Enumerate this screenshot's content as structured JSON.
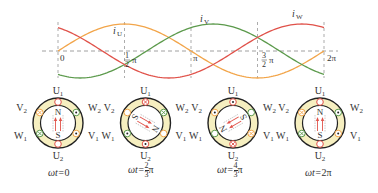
{
  "waveform": {
    "axis": {
      "y_label_zero": "0",
      "x_ticks": [
        {
          "label": "0",
          "x": 58
        },
        {
          "label_num": "1",
          "label_den": "2",
          "label_sym": "π",
          "x": 124.5
        },
        {
          "label": "π",
          "x": 191
        },
        {
          "label_num": "3",
          "label_den": "2",
          "label_sym": "π",
          "x": 257.5
        },
        {
          "label": "2π",
          "x": 324
        }
      ]
    },
    "series_labels": {
      "iU": "i",
      "iU_sub": "U",
      "iV": "i",
      "iV_sub": "V",
      "iW": "i",
      "iW_sub": "W"
    },
    "colors": {
      "iU": "#f2a54a",
      "iV": "#5c9a4c",
      "iW": "#e0524a",
      "grid": "#888888"
    }
  },
  "chart_data": {
    "type": "line",
    "title": "",
    "xlabel": "ωt",
    "ylabel": "i",
    "x_ticks": [
      "0",
      "1/2 π",
      "π",
      "3/2 π",
      "2π"
    ],
    "series": [
      {
        "name": "iU",
        "formula": "sin(ωt)",
        "values_at_ticks": [
          0,
          1,
          0,
          -1,
          0
        ]
      },
      {
        "name": "iV",
        "formula": "sin(ωt - 2π/3)",
        "values_at_ticks": [
          -0.87,
          0.5,
          0.87,
          -0.5,
          -0.87
        ]
      },
      {
        "name": "iW",
        "formula": "sin(ωt + 2π/3)",
        "values_at_ticks": [
          0.87,
          -0.5,
          -0.87,
          0.5,
          0.87
        ]
      }
    ],
    "xlim": [
      0,
      6.283
    ],
    "ylim": [
      -1,
      1
    ],
    "grid": "dashed at ticks"
  },
  "stators": [
    {
      "caption_prefix": "ωt=",
      "caption_value": "0",
      "rotor_angle": 0,
      "labels": {
        "U1": "U",
        "U1s": "1",
        "U2": "U",
        "U2s": "2",
        "V1": "V",
        "V1s": "1",
        "V2": "V",
        "V2s": "2",
        "W1": "W",
        "W1s": "1",
        "W2": "W",
        "W2s": "2"
      },
      "N": "N",
      "S": "S"
    },
    {
      "caption_prefix": "ωt=",
      "caption_num": "2",
      "caption_den": "3",
      "caption_sym": "π",
      "rotor_angle": 120,
      "labels": {
        "U1": "U",
        "U1s": "1",
        "U2": "U",
        "U2s": "2",
        "V1": "V",
        "V1s": "1",
        "V2": "V",
        "V2s": "2",
        "W1": "W",
        "W1s": "1",
        "W2": "W",
        "W2s": "2"
      },
      "N": "N",
      "S": "S"
    },
    {
      "caption_prefix": "ωt=",
      "caption_num": "4",
      "caption_den": "3",
      "caption_sym": "π",
      "rotor_angle": 240,
      "labels": {
        "U1": "U",
        "U1s": "1",
        "U2": "U",
        "U2s": "2",
        "V1": "V",
        "V1s": "1",
        "V2": "V",
        "V2s": "2",
        "W1": "W",
        "W1s": "1",
        "W2": "W",
        "W2s": "2"
      },
      "N": "N",
      "S": "S"
    },
    {
      "caption_prefix": "ωt=",
      "caption_value": "2π",
      "rotor_angle": 0,
      "labels": {
        "U1": "U",
        "U1s": "1",
        "U2": "U",
        "U2s": "2",
        "V1": "V",
        "V1s": "1",
        "V2": "V",
        "V2s": "2",
        "W1": "W",
        "W1s": "1",
        "W2": "W",
        "W2s": "2"
      },
      "N": "N",
      "S": "S"
    }
  ]
}
